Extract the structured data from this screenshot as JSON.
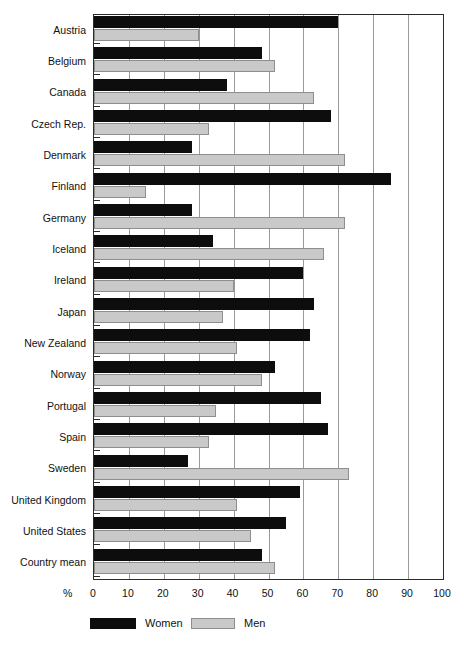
{
  "chart_data": {
    "type": "bar",
    "orientation": "horizontal",
    "title": "",
    "xlabel": "%",
    "ylabel": "",
    "xlim": [
      0,
      100
    ],
    "xticks": [
      0,
      10,
      20,
      30,
      40,
      50,
      60,
      70,
      80,
      90,
      100
    ],
    "grid": true,
    "legend_position": "bottom-left",
    "categories": [
      "Austria",
      "Belgium",
      "Canada",
      "Czech Rep.",
      "Denmark",
      "Finland",
      "Germany",
      "Iceland",
      "Ireland",
      "Japan",
      "New Zealand",
      "Norway",
      "Portugal",
      "Spain",
      "Sweden",
      "United Kingdom",
      "United States",
      "Country mean"
    ],
    "series": [
      {
        "name": "Women",
        "color": "#0d0d0d",
        "values": [
          70,
          48,
          38,
          68,
          28,
          85,
          28,
          34,
          60,
          63,
          62,
          52,
          65,
          67,
          27,
          59,
          55,
          48
        ]
      },
      {
        "name": "Men",
        "color": "#c9c9c9",
        "values": [
          30,
          52,
          63,
          33,
          72,
          15,
          72,
          66,
          40,
          37,
          41,
          48,
          35,
          33,
          73,
          41,
          45,
          52
        ]
      }
    ]
  },
  "axis": {
    "unit_symbol": "%",
    "tick_labels": [
      "0",
      "10",
      "20",
      "30",
      "40",
      "50",
      "60",
      "70",
      "80",
      "90",
      "100"
    ]
  },
  "legend": {
    "items": [
      {
        "label": "Women",
        "color": "#0d0d0d"
      },
      {
        "label": "Men",
        "color": "#c9c9c9"
      }
    ]
  }
}
